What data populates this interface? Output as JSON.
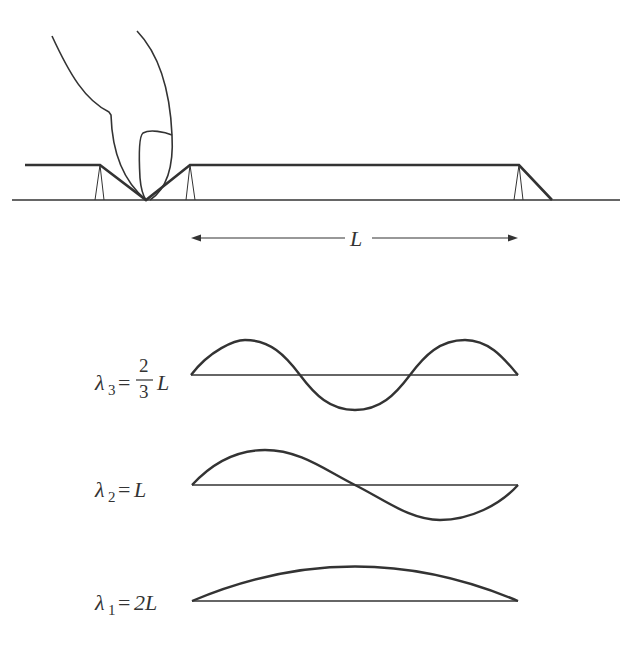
{
  "diagram": {
    "title": "",
    "string_length_label": "L",
    "modes": [
      {
        "id": "lambda3",
        "symbol": "λ",
        "subscript": "3",
        "equals": "=",
        "frac_num": "2",
        "frac_den": "3",
        "tail": "L",
        "half_waves": 3
      },
      {
        "id": "lambda2",
        "symbol": "λ",
        "subscript": "2",
        "equals": "=",
        "tail": "L",
        "half_waves": 2
      },
      {
        "id": "lambda1",
        "symbol": "λ",
        "subscript": "1",
        "equals": "=",
        "tail": "2L",
        "half_waves": 1
      }
    ],
    "colors": {
      "stroke": "#333333",
      "background": "#ffffff"
    }
  }
}
